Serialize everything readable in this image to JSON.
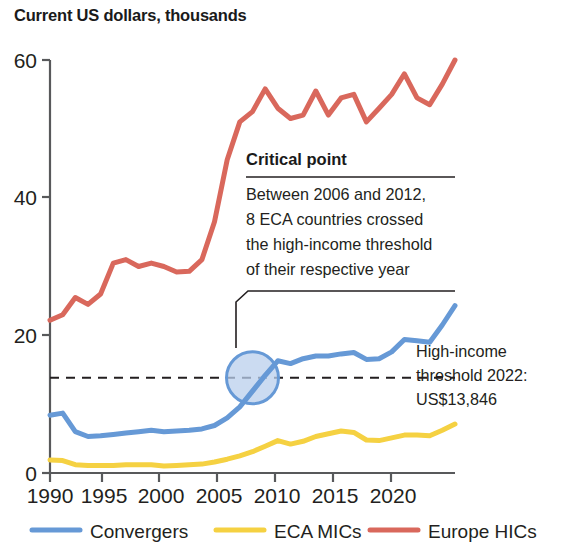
{
  "chart_title": "Current US dollars, thousands",
  "axes": {
    "y_ticks": [
      "0",
      "20",
      "40",
      "60"
    ],
    "x_ticks": [
      "1990",
      "1995",
      "2000",
      "2005",
      "2010",
      "2015",
      "2020"
    ],
    "ylabel": "",
    "xlabel": ""
  },
  "annotation": {
    "heading": "Critical point",
    "line1": "Between 2006 and 2012,",
    "line2": "8 ECA countries crossed",
    "line3": "the high-income threshold",
    "line4": "of their respective year"
  },
  "threshold": {
    "line1": "High-income",
    "line2": "threshold 2022:",
    "line3": "US$13,846",
    "value": 13.846
  },
  "legend": {
    "items": [
      {
        "label": "Convergers",
        "color": "#6699d6"
      },
      {
        "label": "ECA MICs",
        "color": "#f5d142"
      },
      {
        "label": "Europe HICs",
        "color": "#d9685c"
      }
    ]
  },
  "colors": {
    "convergers": "#6699d6",
    "eca_mics": "#f5d142",
    "europe_hics": "#d9685c",
    "axis": "#58595b",
    "text": "#231f20",
    "circle_fill": "#b9cfec",
    "circle_stroke": "#6699d6"
  },
  "chart_data": {
    "type": "line",
    "title": "Current US dollars, thousands",
    "xlabel": "",
    "ylabel": "Current US dollars, thousands",
    "xlim": [
      1990,
      2022
    ],
    "ylim": [
      0,
      60
    ],
    "grid": false,
    "legend_position": "bottom",
    "x": [
      1990,
      1991,
      1992,
      1993,
      1994,
      1995,
      1996,
      1997,
      1998,
      1999,
      2000,
      2001,
      2002,
      2003,
      2004,
      2005,
      2006,
      2007,
      2008,
      2009,
      2010,
      2011,
      2012,
      2013,
      2014,
      2015,
      2016,
      2017,
      2018,
      2019,
      2020,
      2021,
      2022
    ],
    "series": [
      {
        "name": "Convergers",
        "color": "#6699d6",
        "values": [
          8.4,
          8.7,
          6.0,
          5.3,
          5.4,
          5.6,
          5.8,
          6.0,
          6.2,
          6.0,
          6.1,
          6.2,
          6.4,
          6.9,
          8.0,
          9.6,
          11.9,
          14.2,
          16.3,
          15.9,
          16.6,
          17.0,
          17.0,
          17.3,
          17.5,
          16.5,
          16.6,
          17.6,
          19.4,
          19.2,
          19.0,
          21.5,
          24.3
        ]
      },
      {
        "name": "ECA MICs",
        "color": "#f5d142",
        "values": [
          1.9,
          1.8,
          1.2,
          1.1,
          1.1,
          1.1,
          1.2,
          1.2,
          1.2,
          1.0,
          1.1,
          1.2,
          1.3,
          1.6,
          2.0,
          2.5,
          3.1,
          3.9,
          4.7,
          4.2,
          4.6,
          5.3,
          5.7,
          6.1,
          5.9,
          4.8,
          4.7,
          5.1,
          5.5,
          5.5,
          5.4,
          6.2,
          7.1
        ]
      },
      {
        "name": "Europe HICs",
        "color": "#d9685c",
        "values": [
          22.2,
          23.0,
          25.5,
          24.5,
          26.0,
          30.5,
          31.0,
          30.0,
          30.5,
          30.0,
          29.2,
          29.3,
          31.0,
          36.5,
          45.5,
          51.0,
          52.5,
          55.8,
          53.0,
          51.5,
          52.0,
          55.5,
          52.0,
          54.5,
          55.0,
          51.0,
          53.0,
          55.0,
          58.0,
          54.5,
          53.5,
          56.5,
          60.0
        ]
      }
    ],
    "annotations": [
      {
        "kind": "callout",
        "heading": "Critical point",
        "text": "Between 2006 and 2012, 8 ECA countries crossed the high-income threshold of their respective year",
        "points_at_x": 2006,
        "points_at_y": 13.846
      },
      {
        "kind": "threshold-line",
        "text": "High-income threshold 2022: US$13,846",
        "y": 13.846,
        "style": "dashed"
      },
      {
        "kind": "highlight-circle",
        "center_x": 2006,
        "center_y": 13.846
      }
    ]
  }
}
